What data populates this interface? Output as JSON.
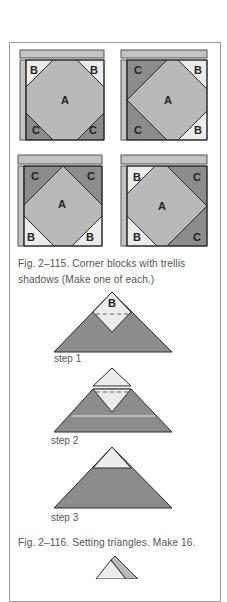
{
  "figure_115": {
    "caption_line1": "Fig. 2–115. Corner blocks with trellis",
    "caption_line2": "shadows (Make one of each.)",
    "blocks": [
      {
        "center_label": "A",
        "top_left": "B",
        "top_right": "B",
        "bottom_left": "C",
        "bottom_right": "C"
      },
      {
        "center_label": "A",
        "top_left": "C",
        "top_right": "B",
        "bottom_left": "C",
        "bottom_right": "B"
      },
      {
        "center_label": "A",
        "top_left": "C",
        "top_right": "C",
        "bottom_left": "B",
        "bottom_right": "B"
      },
      {
        "center_label": "A",
        "top_left": "B",
        "top_right": "C",
        "bottom_left": "B",
        "bottom_right": "C"
      }
    ]
  },
  "figure_116": {
    "caption": "Fig. 2–116. Setting triangles. Make 16.",
    "step1_patch_label": "B",
    "steps": [
      "step 1",
      "step 2",
      "step 3"
    ]
  },
  "colors": {
    "light": "#ececec",
    "medium": "#b9b9b9",
    "dark": "#8c8c8c",
    "outline": "#2a2a2a",
    "frame": "#9a9a9a",
    "caption_text": "#555555"
  }
}
